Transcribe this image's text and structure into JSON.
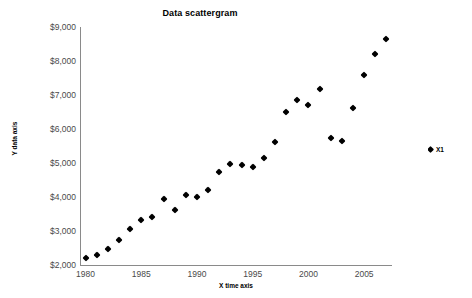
{
  "chart_data": {
    "type": "scatter",
    "title": "Data scattergram",
    "xlabel": "X time axis",
    "ylabel": "Y data axis",
    "xlim": [
      1979.5,
      2007.5
    ],
    "ylim": [
      2000,
      9000
    ],
    "grid": false,
    "legend_position": "right",
    "y_tick_labels": [
      "$9,000",
      "$8,000",
      "$7,000",
      "$6,000",
      "$5,000",
      "$4,000",
      "$3,000",
      "$2,000"
    ],
    "y_tick_values": [
      9000,
      8000,
      7000,
      6000,
      5000,
      4000,
      3000,
      2000
    ],
    "x_tick_labels": [
      "1980",
      "1985",
      "1990",
      "1995",
      "2000",
      "2005"
    ],
    "x_tick_values": [
      1980,
      1985,
      1990,
      1995,
      2000,
      2005
    ],
    "series": [
      {
        "name": "X1",
        "marker": "diamond",
        "color": "#000000",
        "x": [
          1980,
          1981,
          1982,
          1983,
          1984,
          1985,
          1986,
          1987,
          1988,
          1989,
          1990,
          1991,
          1992,
          1993,
          1994,
          1995,
          1996,
          1997,
          1998,
          1999,
          2000,
          2001,
          2002,
          2003,
          2004,
          2005,
          2006,
          2007
        ],
        "y": [
          2200,
          2300,
          2470,
          2750,
          3060,
          3330,
          3400,
          3930,
          3630,
          4060,
          4000,
          4210,
          4750,
          4960,
          4940,
          4870,
          5140,
          5610,
          6500,
          6860,
          6720,
          7180,
          5750,
          5640,
          6620,
          7600,
          8200,
          8650
        ]
      }
    ]
  },
  "legend": {
    "label": "X1"
  }
}
